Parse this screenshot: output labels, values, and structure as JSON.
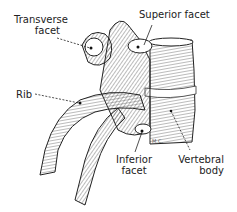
{
  "figure": {
    "labels": {
      "transverse_facet": [
        "Transverse",
        "facet"
      ],
      "superior_facet": "Superior facet",
      "rib": "Rib",
      "inferior_facet": [
        "Inferior",
        "facet"
      ],
      "vertebral_body": [
        "Vertebral",
        "body"
      ]
    },
    "artist_initials": "M.C."
  }
}
